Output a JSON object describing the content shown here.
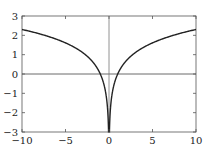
{
  "chart_data": {
    "type": "line",
    "title": "",
    "xlabel": "",
    "ylabel": "",
    "xlim": [
      -10,
      10
    ],
    "ylim": [
      -3,
      3
    ],
    "grid": false,
    "function": "y = ln|x|",
    "x_ticks": [
      -10,
      -5,
      0,
      5,
      10
    ],
    "x_tick_labels": [
      "−10",
      "−5",
      "0",
      "5",
      "10"
    ],
    "y_ticks": [
      3,
      2,
      1,
      0,
      -1,
      -2,
      -3
    ],
    "y_tick_labels": [
      "3",
      "2",
      "1",
      "0",
      "−1",
      "−2",
      "−3"
    ],
    "reference_lines": {
      "x0": true,
      "y0": true
    },
    "series": [
      {
        "name": "ln|x|",
        "x": [
          -10,
          -8,
          -6,
          -4,
          -2,
          -1,
          -0.5,
          -0.2,
          -0.1,
          -0.05,
          0.05,
          0.1,
          0.2,
          0.5,
          1,
          2,
          4,
          6,
          8,
          10
        ],
        "values": [
          2.3,
          2.08,
          1.79,
          1.39,
          0.69,
          0.0,
          -0.69,
          -1.61,
          -2.3,
          -3.0,
          -3.0,
          -2.3,
          -1.61,
          -0.69,
          0.0,
          0.69,
          1.39,
          1.79,
          2.08,
          2.3
        ],
        "color": "#222222"
      }
    ]
  }
}
